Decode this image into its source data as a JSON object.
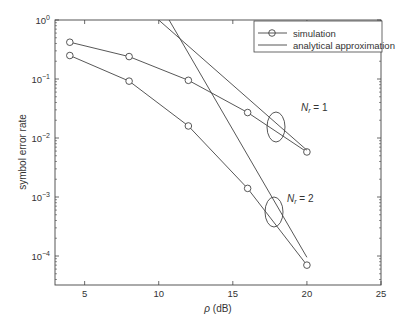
{
  "chart_data": {
    "type": "line",
    "title": "",
    "xlabel": "ρ (dB)",
    "ylabel": "symbol error rate",
    "xlim": [
      3,
      25
    ],
    "ylim": [
      4e-05,
      1
    ],
    "yscale": "log",
    "xticks": [
      5,
      10,
      15,
      20,
      25
    ],
    "yticks": [
      "10^0",
      "10^-1",
      "10^-2",
      "10^-3",
      "10^-4"
    ],
    "legend": {
      "position": "upper right",
      "entries": [
        {
          "label": "simulation",
          "style": "line-circle"
        },
        {
          "label": "analytical approximation",
          "style": "line"
        }
      ]
    },
    "series": [
      {
        "name": "simulation N_r = 1",
        "x": [
          4,
          8,
          12,
          16,
          20
        ],
        "values": [
          0.42,
          0.24,
          0.095,
          0.027,
          0.0058
        ]
      },
      {
        "name": "simulation N_r = 2",
        "x": [
          4,
          8,
          12,
          16,
          20
        ],
        "values": [
          0.25,
          0.092,
          0.016,
          0.0014,
          7e-05
        ]
      },
      {
        "name": "analytical approximation N_r = 1",
        "x": [
          10.0,
          20
        ],
        "values": [
          1.0,
          0.0062
        ]
      },
      {
        "name": "analytical approximation N_r = 2",
        "x": [
          10.7,
          20
        ],
        "values": [
          1.0,
          9.5e-05
        ]
      }
    ],
    "annotations": [
      {
        "text": "N_r = 1",
        "x": 19.5,
        "y": 0.03
      },
      {
        "text": "N_r = 2",
        "x": 19.5,
        "y": 0.0025
      }
    ],
    "grid": false
  },
  "labels": {
    "xlabel_rho": "ρ",
    "xlabel_unit": " (dB)",
    "ylabel": "symbol error rate",
    "legend_sim": "simulation",
    "legend_ana": "analytical approximation",
    "nr1_N": "N",
    "nr1_sub": "r",
    "nr1_rest": " = 1",
    "nr2_N": "N",
    "nr2_sub": "r",
    "nr2_rest": " = 2"
  }
}
